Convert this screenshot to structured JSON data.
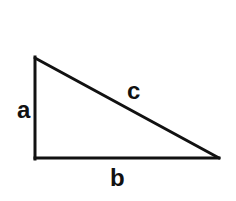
{
  "diagram": {
    "stroke_color": "#111111",
    "background": "#ffffff",
    "vertices": {
      "top": {
        "x": 35,
        "y": 58
      },
      "right_angle": {
        "x": 35,
        "y": 158
      },
      "right": {
        "x": 219,
        "y": 158
      }
    },
    "labels": {
      "a": "a",
      "b": "b",
      "c": "c"
    }
  }
}
